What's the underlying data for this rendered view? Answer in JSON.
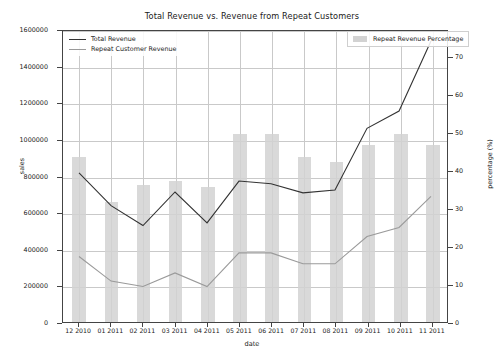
{
  "chart_data": {
    "type": "bar",
    "title": "Total Revenue vs. Revenue from Repeat Customers",
    "xlabel": "date",
    "ylabel": "sales",
    "y2label": "percentage (%)",
    "categories": [
      "12 2010",
      "01 2011",
      "02 2011",
      "03 2011",
      "04 2011",
      "05 2011",
      "06 2011",
      "07 2011",
      "08 2011",
      "09 2011",
      "10 2011",
      "11 2011"
    ],
    "ylim": [
      0,
      1600000
    ],
    "y2lim": [
      0,
      77
    ],
    "yticks": [
      "0",
      "200000",
      "400000",
      "600000",
      "800000",
      "1000000",
      "1200000",
      "1400000",
      "1600000"
    ],
    "ytick_values": [
      0,
      200000,
      400000,
      600000,
      800000,
      1000000,
      1200000,
      1400000,
      1600000
    ],
    "y2ticks": [
      "0",
      "10",
      "20",
      "30",
      "40",
      "50",
      "60",
      "70"
    ],
    "y2tick_values": [
      0,
      10,
      20,
      30,
      40,
      50,
      60,
      70
    ],
    "grid": true,
    "legend_position": "upper-left and upper-right",
    "series": [
      {
        "name": "Total Revenue",
        "kind": "line",
        "axis": "left",
        "color": "#333333",
        "values": [
          820000,
          640000,
          530000,
          715000,
          545000,
          775000,
          760000,
          710000,
          725000,
          1065000,
          1160000,
          1545000
        ]
      },
      {
        "name": "Repeat Customer Revenue",
        "kind": "line",
        "axis": "left",
        "color": "#9a9a9a",
        "values": [
          360000,
          225000,
          195000,
          270000,
          195000,
          380000,
          380000,
          320000,
          320000,
          470000,
          520000,
          690000
        ]
      },
      {
        "name": "Repeat Revenue Percentage",
        "kind": "bar",
        "axis": "right",
        "color": "#d2d2d2",
        "values": [
          43.5,
          31.5,
          36.0,
          37.0,
          35.5,
          49.5,
          49.5,
          43.5,
          42.0,
          46.5,
          49.5,
          46.5
        ]
      }
    ]
  },
  "legend": {
    "lines": [
      {
        "label": "Total Revenue"
      },
      {
        "label": "Repeat Customer Revenue"
      }
    ],
    "bars": {
      "label": "Repeat Revenue Percentage"
    }
  }
}
